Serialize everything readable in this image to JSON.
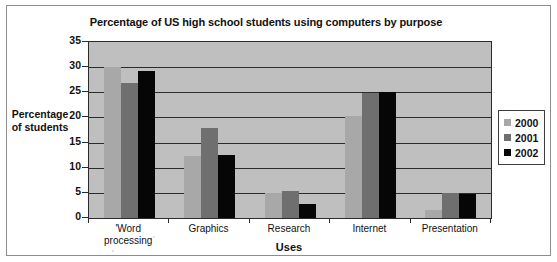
{
  "chart_data": {
    "type": "bar",
    "title": "Percentage of US high school students using computers by purpose",
    "xlabel": "Uses",
    "ylabel": "Percentage of students",
    "ylabel_lines": [
      "Percentage",
      "of students"
    ],
    "categories": [
      "Word processing",
      "Graphics",
      "Research",
      "Internet",
      "Presentation"
    ],
    "category_label_lines": [
      [
        "'Word",
        "processing"
      ],
      [
        "Graphics"
      ],
      [
        "Research"
      ],
      [
        "Internet"
      ],
      [
        "Presentation"
      ]
    ],
    "series": [
      {
        "name": "2000",
        "color": "#a8a8a8",
        "values": [
          30.0,
          12.3,
          4.9,
          20.3,
          1.6
        ]
      },
      {
        "name": "2001",
        "color": "#6f6f6f",
        "values": [
          26.8,
          18.0,
          5.3,
          24.8,
          4.9
        ]
      },
      {
        "name": "2002",
        "color": "#060606",
        "values": [
          29.3,
          12.5,
          2.7,
          25.0,
          4.8
        ]
      }
    ],
    "ylim": [
      0,
      35
    ],
    "yticks": [
      0,
      5,
      10,
      15,
      20,
      25,
      30,
      35
    ],
    "ytick_labels": [
      "0",
      "5",
      "10",
      "15",
      "20",
      "25",
      "30",
      "35"
    ],
    "grid": true,
    "grid_axis": "y",
    "legend_position": "right",
    "plot_background": "#bfbfbf",
    "figure_background": "#ffffff",
    "axis_color": "#2b2b2b"
  }
}
